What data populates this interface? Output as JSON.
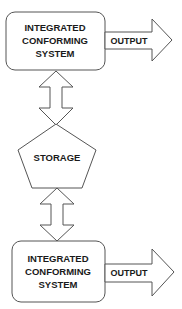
{
  "diagram": {
    "top_box": {
      "lines": [
        "INTEGRATED",
        "CONFORMING",
        "SYSTEM"
      ]
    },
    "top_output": {
      "label": "OUTPUT"
    },
    "storage": {
      "label": "STORAGE"
    },
    "bottom_box": {
      "lines": [
        "INTEGRATED",
        "CONFORMING",
        "SYSTEM"
      ]
    },
    "bottom_output": {
      "label": "OUTPUT"
    },
    "colors": {
      "stroke": "#555555",
      "fill": "#ffffff",
      "text": "#1a1a1a"
    }
  }
}
